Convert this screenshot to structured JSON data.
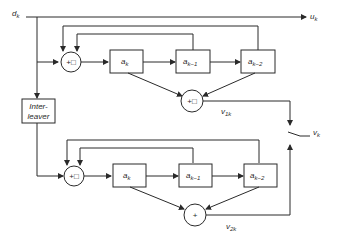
{
  "diagram": {
    "type": "block-diagram",
    "title": "",
    "input": {
      "label": "d",
      "sub": "k"
    },
    "outputs": {
      "systematic": {
        "label": "u",
        "sub": "k"
      },
      "parity1": {
        "label": "v",
        "sub": "1k"
      },
      "parity2": {
        "label": "v",
        "sub": "2k"
      },
      "punctured": {
        "label": "v",
        "sub": "k"
      }
    },
    "interleaver": {
      "line1": "Inter-",
      "line2": "leaver"
    },
    "encoder1": {
      "input_adder": "+□",
      "registers": [
        {
          "label": "a",
          "sub": "k"
        },
        {
          "label": "a",
          "sub": "k−1"
        },
        {
          "label": "a",
          "sub": "k−2"
        }
      ],
      "output_adder": "+□"
    },
    "encoder2": {
      "input_adder": "+□",
      "registers": [
        {
          "label": "a",
          "sub": "k"
        },
        {
          "label": "a",
          "sub": "k−1"
        },
        {
          "label": "a",
          "sub": "k−2"
        }
      ],
      "output_adder": "+"
    },
    "colors": {
      "stroke": "#2a2a2a",
      "background": "#ffffff"
    }
  }
}
